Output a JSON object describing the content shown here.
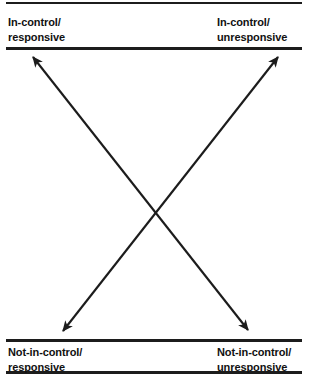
{
  "figure": {
    "name": "control-responsiveness-matrix",
    "quadrants": {
      "top_left": {
        "label": "In-control/\nresponsive"
      },
      "top_right": {
        "label": "In-control/\nunresponsive"
      },
      "bottom_left": {
        "label": "Not-in-control/\nresponsive"
      },
      "bottom_right": {
        "label": "Not-in-control/\nunresponsive"
      }
    },
    "arrows": [
      {
        "name": "diagonal-arrow-tl-br",
        "from": "bottom_right",
        "to": "top_left",
        "double_headed": true,
        "tip_start": [
          248,
          330
        ],
        "tip_end": [
          33,
          57
        ]
      },
      {
        "name": "diagonal-arrow-bl-tr",
        "from": "bottom_left",
        "to": "top_right",
        "double_headed": true,
        "tip_start": [
          63,
          331
        ],
        "tip_end": [
          278,
          57
        ]
      }
    ],
    "crossing_point": [
      155,
      212
    ],
    "colors": {
      "ink": "#1c1c1c",
      "text": "#111111",
      "background": "#ffffff"
    },
    "rules": [
      {
        "name": "rule-top",
        "y": 2
      },
      {
        "name": "rule-header",
        "y": 47
      },
      {
        "name": "rule-footer-a",
        "y": 339
      },
      {
        "name": "rule-footer-b",
        "y": 371
      }
    ]
  }
}
